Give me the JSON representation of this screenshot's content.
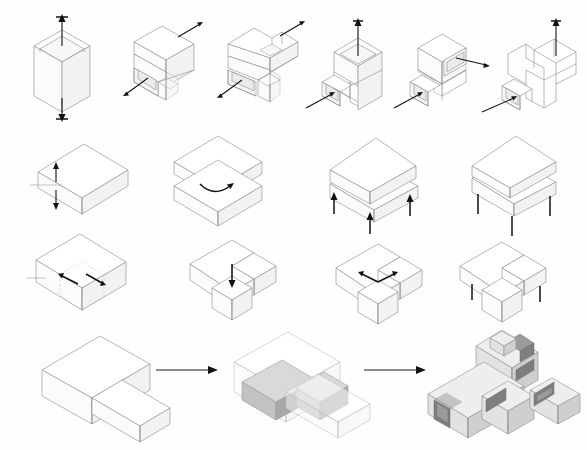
{
  "sheet": {
    "title": "Architectural Massing Transformation Diagram Sheet",
    "background_color": "#fefefe",
    "width": 587,
    "height": 450,
    "line_color": "#8a8a8a",
    "arrow_color": "#111111",
    "hidden_line_color": "#b5b5b5",
    "projection": "isometric",
    "has_text_labels": false
  },
  "rows": [
    {
      "id": "row-1",
      "name": "vertical-extrusion-and-carving-sequence",
      "y": 12,
      "step_count": 6,
      "description": "Tall vertical volume progressively carved and stepped, each step annotated with push/pull arrows",
      "steps": [
        {
          "index": 1,
          "name": "tall-prism-with-vertical-arrows",
          "x": 22,
          "arrows": [
            {
              "name": "arrow-up",
              "direction": "up",
              "length": 24
            },
            {
              "name": "arrow-down",
              "direction": "down",
              "length": 24
            }
          ]
        },
        {
          "index": 2,
          "name": "stepped-volume-with-lower-recess",
          "x": 118,
          "arrows": [
            {
              "name": "arrow-upper-right-pull",
              "direction": "upper-right",
              "length": 20
            },
            {
              "name": "arrow-lower-left-push",
              "direction": "lower-left",
              "length": 20
            }
          ]
        },
        {
          "index": 3,
          "name": "double-notched-volume",
          "x": 214,
          "arrows": [
            {
              "name": "arrow-upper-right-pull",
              "direction": "upper-right",
              "length": 20
            },
            {
              "name": "arrow-lower-left-push",
              "direction": "lower-left",
              "length": 20
            }
          ]
        },
        {
          "index": 4,
          "name": "hollow-shaft-with-base-recess",
          "x": 308,
          "arrows": [
            {
              "name": "arrow-up-through-shaft",
              "direction": "up",
              "length": 30
            },
            {
              "name": "arrow-lower-left-into-recess",
              "direction": "lower-left",
              "length": 34
            }
          ]
        },
        {
          "index": 5,
          "name": "two-tier-stepped-volume-with-openings",
          "x": 398,
          "arrows": [
            {
              "name": "arrow-right-out-of-upper-opening",
              "direction": "right",
              "length": 34
            },
            {
              "name": "arrow-lower-left-into-base",
              "direction": "lower-left",
              "length": 34
            }
          ]
        },
        {
          "index": 6,
          "name": "final-stepped-skeleton-with-roof-aperture",
          "x": 488,
          "arrows": [
            {
              "name": "arrow-up-through-roof-aperture",
              "direction": "up",
              "length": 30
            },
            {
              "name": "arrow-lower-left-into-base",
              "direction": "lower-left",
              "length": 38
            }
          ]
        }
      ]
    },
    {
      "id": "row-2",
      "name": "slab-stacking-rotation-and-lifting-sequence",
      "y": 132,
      "step_count": 4,
      "description": "Horizontal slab split, rotated, then lifted on pilotis columns",
      "steps": [
        {
          "index": 1,
          "name": "single-slab-with-split-arrows",
          "x": 28,
          "arrows": [
            {
              "name": "arrow-split-up",
              "direction": "up",
              "length": 16
            },
            {
              "name": "arrow-split-down",
              "direction": "down",
              "length": 16
            }
          ]
        },
        {
          "index": 2,
          "name": "two-stacked-slabs-with-rotation-arrow",
          "x": 166,
          "arrows": [
            {
              "name": "arrow-rotate-curved",
              "direction": "curved-clockwise",
              "length": 28
            }
          ]
        },
        {
          "index": 3,
          "name": "rotated-upper-slab-with-lift-arrows",
          "x": 316,
          "arrows": [
            {
              "name": "arrow-lift-left",
              "direction": "up",
              "length": 20
            },
            {
              "name": "arrow-lift-center",
              "direction": "up",
              "length": 22
            },
            {
              "name": "arrow-lift-right",
              "direction": "up",
              "length": 20
            }
          ]
        },
        {
          "index": 4,
          "name": "rotated-slab-raised-on-columns",
          "x": 452,
          "arrows": [
            {
              "name": "column-left",
              "direction": "vertical-support",
              "length": 18
            },
            {
              "name": "column-center",
              "direction": "vertical-support",
              "length": 20
            },
            {
              "name": "column-right",
              "direction": "vertical-support",
              "length": 18
            }
          ]
        }
      ]
    },
    {
      "id": "row-3",
      "name": "courtyard-carving-and-lifting-sequence",
      "y": 230,
      "step_count": 4,
      "description": "Rectangular mass with a corner volume carved out, dropped, then raised on columns",
      "steps": [
        {
          "index": 1,
          "name": "block-with-dashed-carve-outline",
          "x": 26,
          "arrows": [
            {
              "name": "arrow-carve-left",
              "direction": "upper-left",
              "length": 16
            },
            {
              "name": "arrow-carve-right",
              "direction": "lower-right",
              "length": 16
            }
          ]
        },
        {
          "index": 2,
          "name": "l-shaped-mass-with-dropped-cube",
          "x": 180,
          "arrows": [
            {
              "name": "arrow-push-down",
              "direction": "down",
              "length": 22
            }
          ]
        },
        {
          "index": 3,
          "name": "l-shaped-mass-with-spread-arrows",
          "x": 324,
          "arrows": [
            {
              "name": "arrow-spread-left",
              "direction": "upper-left",
              "length": 16
            },
            {
              "name": "arrow-spread-right",
              "direction": "upper-right",
              "length": 16
            }
          ]
        },
        {
          "index": 4,
          "name": "courtyard-mass-raised-on-columns",
          "x": 446,
          "arrows": [
            {
              "name": "column-left",
              "direction": "vertical-support",
              "length": 16
            },
            {
              "name": "column-right",
              "direction": "vertical-support",
              "length": 16
            }
          ]
        }
      ]
    },
    {
      "id": "row-4",
      "name": "final-massing-to-rendered-building-sequence",
      "y": 330,
      "step_count": 3,
      "description": "Wireframe massing transforms to ghosted solid-void study, then to rendered building model",
      "steps": [
        {
          "index": 1,
          "name": "wireframe-l-massing",
          "x": 20,
          "style": "wireframe"
        },
        {
          "index": 2,
          "name": "ghosted-volume-with-solid-inserts",
          "x": 222,
          "style": "ghosted-solid"
        },
        {
          "index": 3,
          "name": "rendered-cross-bar-building",
          "x": 428,
          "style": "rendered"
        }
      ],
      "connectors": [
        {
          "name": "flow-arrow-1",
          "x": 158,
          "y": 368,
          "length": 56,
          "direction": "right"
        },
        {
          "name": "flow-arrow-2",
          "x": 366,
          "y": 368,
          "length": 56,
          "direction": "right"
        }
      ]
    }
  ],
  "colors": {
    "paper": "#fefefe",
    "line": "#8a8a8a",
    "hidden_line": "#b5b5b5",
    "arrow": "#111111",
    "face_top": "#ffffff",
    "face_left": "#fbfbfb",
    "face_right": "#f2f2f2",
    "solid_fill": "#c2c2c2",
    "render_fill": "#e2e2e2",
    "glass_fill": "#9b9b9b"
  }
}
